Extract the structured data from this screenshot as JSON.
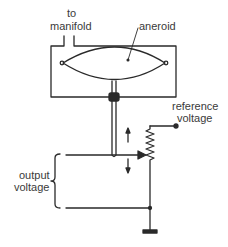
{
  "diagram": {
    "title": "",
    "labels": {
      "manifold_line1": "to",
      "manifold_line2": "manifold",
      "aneroid": "aneroid",
      "reference_line1": "reference",
      "reference_line2": "voltage",
      "output_line1": "output",
      "output_line2": "voltage"
    },
    "components": [
      "housing",
      "manifold-pipe",
      "aneroid-capsule",
      "push-rod",
      "seal",
      "potentiometer",
      "wiper",
      "reference-terminal",
      "ground"
    ],
    "colors": {
      "line": "#2a2a2a",
      "text": "#3a3a3a",
      "background": "#ffffff"
    }
  }
}
